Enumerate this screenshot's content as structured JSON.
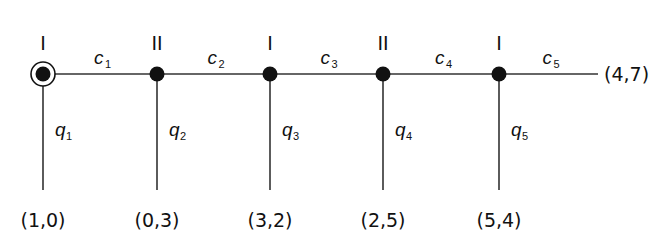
{
  "diagram": {
    "type": "tree-graph",
    "nodes": [
      {
        "player": "I",
        "x": 43,
        "initial": true,
        "edge_label": "c",
        "edge_sub": "1",
        "down_label": "q",
        "down_sub": "1",
        "payoff": "(1,0)"
      },
      {
        "player": "II",
        "x": 157,
        "initial": false,
        "edge_label": "c",
        "edge_sub": "2",
        "down_label": "q",
        "down_sub": "2",
        "payoff": "(0,3)"
      },
      {
        "player": "I",
        "x": 270,
        "initial": false,
        "edge_label": "c",
        "edge_sub": "3",
        "down_label": "q",
        "down_sub": "3",
        "payoff": "(3,2)"
      },
      {
        "player": "II",
        "x": 383,
        "initial": false,
        "edge_label": "c",
        "edge_sub": "4",
        "down_label": "q",
        "down_sub": "4",
        "payoff": "(2,5)"
      },
      {
        "player": "I",
        "x": 499,
        "initial": false,
        "edge_label": "c",
        "edge_sub": "5",
        "down_label": "q",
        "down_sub": "5",
        "payoff": "(5,4)"
      }
    ],
    "terminal_payoff": "(4,7)",
    "colors": {
      "line": "#333333",
      "node": "#111111",
      "text": "#111111"
    }
  }
}
